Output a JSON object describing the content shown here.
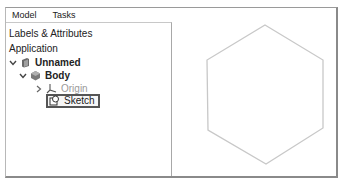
{
  "tabs": [
    {
      "label": "Model",
      "active": true
    },
    {
      "label": "Tasks",
      "active": false
    }
  ],
  "panel": {
    "title": "Labels & Attributes",
    "section": "Application"
  },
  "tree": [
    {
      "label": "Unnamed",
      "level": 0,
      "expanded": true,
      "bold": true,
      "icon": "document-icon"
    },
    {
      "label": "Body",
      "level": 1,
      "expanded": true,
      "bold": true,
      "icon": "body-icon"
    },
    {
      "label": "Origin",
      "level": 2,
      "expanded": false,
      "bold": false,
      "muted": true,
      "icon": "origin-axes-icon"
    },
    {
      "label": "Sketch",
      "level": 2,
      "expanded": null,
      "bold": false,
      "selected": true,
      "icon": "sketch-icon"
    }
  ],
  "viewport": {
    "shape": "hexagon",
    "stroke_color": "#c8c8c8"
  },
  "colors": {
    "frame_border": "#8a8a8a",
    "text": "#222222",
    "muted_text": "#9a9a9a",
    "selection_border": "#555555"
  }
}
